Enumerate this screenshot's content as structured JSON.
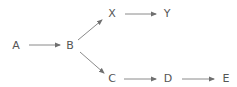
{
  "diagram": {
    "type": "directed-graph",
    "colors": {
      "node_text": "#555555",
      "edge": "#8a8a8a",
      "background": "#ffffff"
    },
    "nodes": [
      {
        "id": "A",
        "label": "A",
        "x": 16,
        "y": 46
      },
      {
        "id": "B",
        "label": "B",
        "x": 70,
        "y": 46
      },
      {
        "id": "X",
        "label": "X",
        "x": 112,
        "y": 14
      },
      {
        "id": "Y",
        "label": "Y",
        "x": 167,
        "y": 14
      },
      {
        "id": "C",
        "label": "C",
        "x": 112,
        "y": 79
      },
      {
        "id": "D",
        "label": "D",
        "x": 168,
        "y": 79
      },
      {
        "id": "E",
        "label": "E",
        "x": 226,
        "y": 79
      }
    ],
    "edges": [
      {
        "from": "A",
        "to": "B",
        "x1": 29,
        "y1": 45,
        "x2": 60,
        "y2": 45
      },
      {
        "from": "B",
        "to": "X",
        "x1": 78,
        "y1": 40,
        "x2": 102,
        "y2": 20
      },
      {
        "from": "X",
        "to": "Y",
        "x1": 125,
        "y1": 14,
        "x2": 156,
        "y2": 14
      },
      {
        "from": "B",
        "to": "C",
        "x1": 80,
        "y1": 52,
        "x2": 104,
        "y2": 73
      },
      {
        "from": "C",
        "to": "D",
        "x1": 124,
        "y1": 79,
        "x2": 156,
        "y2": 79
      },
      {
        "from": "D",
        "to": "E",
        "x1": 182,
        "y1": 79,
        "x2": 214,
        "y2": 79
      }
    ]
  }
}
